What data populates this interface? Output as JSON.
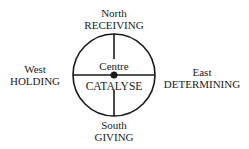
{
  "diagram": {
    "north": {
      "direction": "North",
      "quality": "RECEIVING"
    },
    "south": {
      "direction": "South",
      "quality": "GIVING"
    },
    "west": {
      "direction": "West",
      "quality": "HOLDING"
    },
    "east": {
      "direction": "East",
      "quality": "DETERMINING"
    },
    "centre": {
      "label": "Centre",
      "quality": "CATALYSE"
    }
  }
}
